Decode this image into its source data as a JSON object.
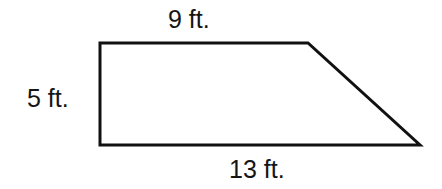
{
  "figure": {
    "name": "right-trapezoid",
    "background_color": "#ffffff",
    "stroke_color": "#111111",
    "stroke_width": 3,
    "text_color": "#151515",
    "vertices": {
      "top_left": [
        100,
        43
      ],
      "top_right": [
        308,
        43
      ],
      "bottom_right": [
        420,
        145
      ],
      "bottom_left": [
        100,
        145
      ]
    },
    "polygon_points": "100,43 308,43 420,145 100,145"
  },
  "labels": {
    "top": "9 ft.",
    "left": "5 ft.",
    "bottom": "13 ft."
  },
  "chart_data": {
    "type": "diagram",
    "shape": "right trapezoid",
    "title": "",
    "measurements": [
      {
        "side": "top",
        "label": "9 ft.",
        "value": 9,
        "unit": "ft."
      },
      {
        "side": "left",
        "label": "5 ft.",
        "value": 5,
        "unit": "ft."
      },
      {
        "side": "bottom",
        "label": "13 ft.",
        "value": 13,
        "unit": "ft."
      }
    ],
    "unlabeled_sides": [
      "slant-right"
    ],
    "annotations": []
  }
}
